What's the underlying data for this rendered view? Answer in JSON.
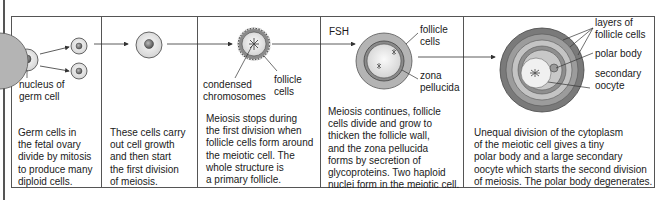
{
  "diagram": {
    "hormone_label": "FSH",
    "stages": [
      {
        "id": "stage-1",
        "labels": [
          "nucleus of\ngerm cell"
        ],
        "description": "Germ cells in\nthe fetal ovary\ndivide by mitosis\nto produce many\ndiploid cells."
      },
      {
        "id": "stage-2",
        "labels": [],
        "description": "These cells carry\nout cell growth\nand then start\nthe first division\nof meiosis."
      },
      {
        "id": "stage-3",
        "labels": [
          "condensed\nchromosomes",
          "follicle\ncells"
        ],
        "description": "Meiosis stops during\nthe first division when\nfollicle cells form around\nthe meiotic cell. The\nwhole structure is\na primary follicle."
      },
      {
        "id": "stage-4",
        "labels": [
          "follicle\ncells",
          "zona\npellucida"
        ],
        "description": "Meiosis continues, follicle\ncells divide and grow to\nthicken the follicle wall,\nand the zona pellucida\nforms by secretion of\nglycoproteins. Two haploid\nnuclei form in the meiotic cell."
      },
      {
        "id": "stage-5",
        "labels": [
          "layers of\nfollicle cells",
          "polar body",
          "secondary\noocyte"
        ],
        "description": "Unequal division of the cytoplasm\nof the meiotic cell gives a tiny\npolar body and a large secondary\noocyte which starts the second division\nof meiosis. The polar body degenerates."
      }
    ],
    "colors": {
      "line": "#333333",
      "cell_fill": "#e8e8e8",
      "nucleus": "#777777",
      "follicle_dark": "#7a7a7a",
      "follicle_mid": "#a8a8a8",
      "follicle_light": "#d0d0d0"
    }
  }
}
